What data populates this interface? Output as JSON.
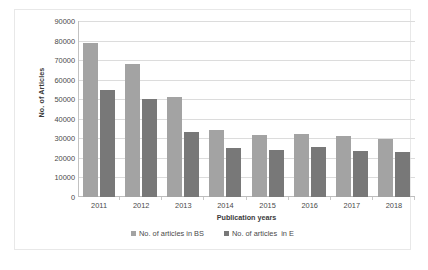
{
  "chart_data": {
    "type": "bar",
    "title": "",
    "categories": [
      "2011",
      "2012",
      "2013",
      "2014",
      "2015",
      "2016",
      "2017",
      "2018"
    ],
    "series": [
      {
        "name": "No. of articles in BS",
        "color": "#a3a3a3",
        "values": [
          79000,
          68000,
          51000,
          34500,
          31500,
          32000,
          31000,
          29500
        ]
      },
      {
        "name": "No. of articles  in E",
        "color": "#787878",
        "values": [
          54500,
          50000,
          33000,
          25000,
          24000,
          25500,
          23500,
          23000
        ]
      }
    ],
    "xlabel": "Publication years",
    "ylabel": "No. of Articles",
    "ylim": [
      0,
      90000
    ],
    "ytick_step": 10000,
    "yticks": [
      "0",
      "10000",
      "20000",
      "30000",
      "40000",
      "50000",
      "60000",
      "70000",
      "80000",
      "90000"
    ],
    "grid": true,
    "legend_position": "bottom-center"
  },
  "legend": {
    "items": [
      {
        "label": "No. of articles in BS"
      },
      {
        "label": "No. of articles  in E"
      }
    ]
  }
}
